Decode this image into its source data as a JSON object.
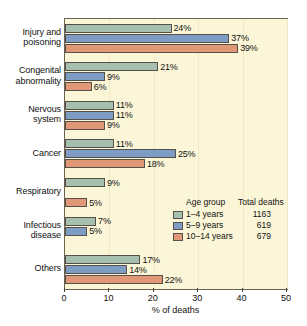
{
  "chart_data": {
    "type": "bar",
    "orientation": "horizontal",
    "title": "",
    "xlabel": "% of deaths",
    "ylabel": "",
    "xlim": [
      0,
      50
    ],
    "xticks": [
      0,
      10,
      20,
      30,
      40,
      50
    ],
    "xtick_labels": [
      "0",
      "10",
      "20",
      "30",
      "40",
      "50"
    ],
    "grid": true,
    "legend_position": "inside-center-right",
    "categories": [
      "Injury and poisoning",
      "Congenital abnormality",
      "Nervous system",
      "Cancer",
      "Respiratory",
      "Infectious disease",
      "Others"
    ],
    "category_lines": [
      [
        "Injury and",
        "poisoning"
      ],
      [
        "Congenital",
        "abnormality"
      ],
      [
        "Nervous",
        "system"
      ],
      [
        "Cancer"
      ],
      [
        "Respiratory"
      ],
      [
        "Infectious",
        "disease"
      ],
      [
        "Others"
      ]
    ],
    "series": [
      {
        "name": "1–4 years",
        "total_deaths": "1163",
        "color": "#a7bfae",
        "values": [
          24,
          21,
          11,
          11,
          9,
          7,
          17
        ],
        "labels": [
          "24%",
          "21%",
          "11%",
          "11%",
          "9%",
          "7%",
          "17%"
        ]
      },
      {
        "name": "5–9 years",
        "total_deaths": "619",
        "color": "#7d9dc4",
        "values": [
          37,
          9,
          11,
          25,
          0,
          5,
          14
        ],
        "labels": [
          "37%",
          "9%",
          "11%",
          "25%",
          "",
          "5%",
          "14%"
        ]
      },
      {
        "name": "10–14 years",
        "total_deaths": "679",
        "color": "#e09877",
        "values": [
          39,
          6,
          9,
          18,
          5,
          0,
          22
        ],
        "labels": [
          "39%",
          "6%",
          "9%",
          "18%",
          "5%",
          "",
          "22%"
        ]
      }
    ]
  },
  "legend": {
    "header_group": "Age group",
    "header_total": "Total deaths"
  },
  "colors": {
    "plot_background": "#fbf6d8",
    "plot_border": "#6b6151",
    "gridline": "#f2e9c2",
    "series_1_4": "#a7bfae",
    "series_5_9": "#7d9dc4",
    "series_10_14": "#e09877",
    "bar_outline": "#56504a"
  }
}
